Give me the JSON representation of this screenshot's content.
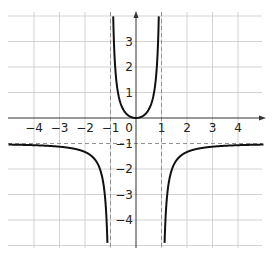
{
  "chart_data": {
    "type": "line",
    "title": "",
    "function": "y = x^2 / (1 - x^2)",
    "xlabel": "",
    "ylabel": "",
    "xlim": [
      -5,
      5
    ],
    "ylim": [
      -5,
      4
    ],
    "grid": true,
    "x_ticks": [
      "-4",
      "-3",
      "-2",
      "-1",
      "0",
      "1",
      "2",
      "3",
      "4"
    ],
    "y_ticks": [
      "3",
      "2",
      "1",
      "-1",
      "-2",
      "-4",
      "-3"
    ],
    "asymptotes": {
      "vertical": [
        -1,
        1
      ],
      "horizontal": [
        -1
      ]
    },
    "series": [
      {
        "name": "middle branch",
        "x": [
          -0.96,
          -0.9,
          -0.8,
          -0.6,
          -0.4,
          -0.2,
          0,
          0.2,
          0.4,
          0.6,
          0.8,
          0.9,
          0.96
        ],
        "y": [
          11.76,
          4.26,
          1.78,
          0.56,
          0.19,
          0.04,
          0,
          0.04,
          0.19,
          0.56,
          1.78,
          4.26,
          11.76
        ]
      },
      {
        "name": "left branch",
        "x": [
          -5,
          -4,
          -3,
          -2,
          -1.5,
          -1.2,
          -1.1
        ],
        "y": [
          -1.04,
          -1.07,
          -1.13,
          -1.33,
          -1.8,
          -3.27,
          -5.76
        ]
      },
      {
        "name": "right branch",
        "x": [
          1.1,
          1.2,
          1.5,
          2,
          3,
          4,
          5
        ],
        "y": [
          -5.76,
          -3.27,
          -1.8,
          -1.33,
          -1.13,
          -1.07,
          -1.04
        ]
      }
    ]
  },
  "labels": {
    "x": [
      "−4",
      "−3",
      "−2",
      "−1",
      "0",
      "1",
      "2",
      "3",
      "4"
    ],
    "y_pos": [
      "1",
      "2",
      "3"
    ],
    "y_neg": [
      "−1",
      "−2",
      "−3",
      "−4"
    ]
  }
}
